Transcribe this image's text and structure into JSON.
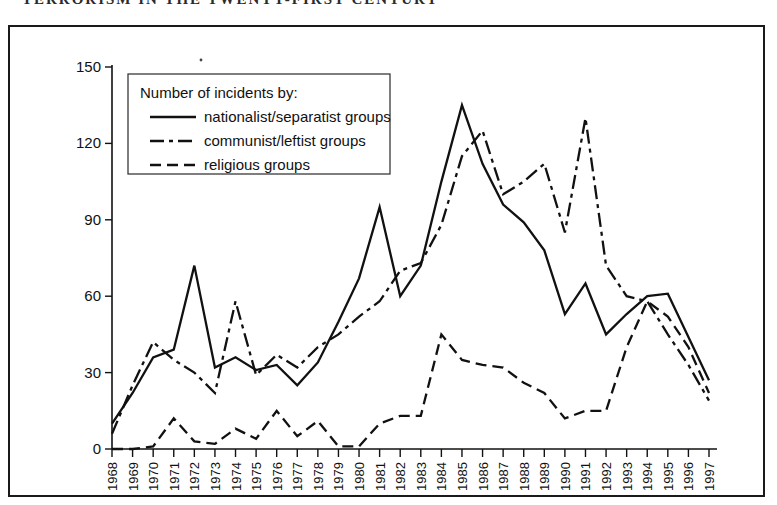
{
  "page": {
    "header_fragment": "TERRORISM IN THE TWENTY-FIRST CENTURY"
  },
  "figure": {
    "frame_label": "figure-border"
  },
  "legend": {
    "title": "Number of incidents by:",
    "entries": [
      {
        "label": "nationalist/separatist groups",
        "style": "solid",
        "dash": "none"
      },
      {
        "label": "communist/leftist groups",
        "style": "dash-dot",
        "dash": "14,5,4,5"
      },
      {
        "label": "religious groups",
        "style": "dashed",
        "dash": "11,6"
      }
    ]
  },
  "chart_data": {
    "type": "line",
    "title": "",
    "subtitle": "",
    "xlabel": "",
    "ylabel": "",
    "grid": false,
    "legend_position": "top-left-inset",
    "xlim": [
      1968,
      1997
    ],
    "ylim": [
      0,
      150
    ],
    "yticks": [
      0,
      30,
      60,
      90,
      120,
      150
    ],
    "ytick_labels": [
      "0",
      "30",
      "60",
      "90",
      "120",
      "150"
    ],
    "x": [
      1968,
      1969,
      1970,
      1971,
      1972,
      1973,
      1974,
      1975,
      1976,
      1977,
      1978,
      1979,
      1980,
      1981,
      1982,
      1983,
      1984,
      1985,
      1986,
      1987,
      1988,
      1989,
      1990,
      1991,
      1992,
      1993,
      1994,
      1995,
      1996,
      1997
    ],
    "xtick_labels": [
      "1968",
      "1969",
      "1970",
      "1971",
      "1972",
      "1973",
      "1974",
      "1975",
      "1976",
      "1977",
      "1978",
      "1979",
      "1980",
      "1981",
      "1982",
      "1983",
      "1984",
      "1985",
      "1986",
      "1987",
      "1988",
      "1989",
      "1990",
      "1991",
      "1992",
      "1993",
      "1994",
      "1995",
      "1996",
      "1997"
    ],
    "series": [
      {
        "name": "nationalist/separatist groups",
        "style": "solid",
        "values": [
          10,
          22,
          36,
          39,
          72,
          32,
          36,
          31,
          33,
          25,
          34,
          50,
          67,
          95,
          60,
          72,
          105,
          135,
          112,
          96,
          89,
          78,
          53,
          65,
          45,
          53,
          60,
          61,
          44,
          27
        ]
      },
      {
        "name": "communist/leftist groups",
        "style": "dash-dot",
        "values": [
          6,
          25,
          42,
          35,
          30,
          22,
          58,
          29,
          37,
          32,
          40,
          45,
          52,
          58,
          70,
          73,
          88,
          115,
          125,
          100,
          105,
          112,
          85,
          130,
          72,
          60,
          58,
          45,
          33,
          19
        ]
      },
      {
        "name": "religious groups",
        "style": "dashed",
        "values": [
          0,
          0,
          1,
          12,
          3,
          2,
          8,
          4,
          15,
          5,
          11,
          1,
          1,
          10,
          13,
          13,
          45,
          35,
          33,
          32,
          26,
          22,
          12,
          15,
          15,
          40,
          58,
          52,
          40,
          22
        ]
      }
    ]
  }
}
